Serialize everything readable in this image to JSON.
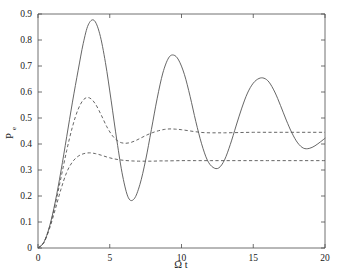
{
  "chart_data": {
    "type": "line",
    "title": "",
    "xlabel": "Ω t",
    "ylabel": "P",
    "ylabel_sub": "e",
    "xlim": [
      0,
      20
    ],
    "ylim": [
      0,
      0.9
    ],
    "xticks": [
      0,
      5,
      10,
      15,
      20
    ],
    "xtick_labels": [
      "0",
      "5",
      "10",
      "15",
      "20"
    ],
    "yticks": [
      0,
      0.1,
      0.2,
      0.3,
      0.4,
      0.5,
      0.6,
      0.7,
      0.8,
      0.9
    ],
    "ytick_labels": [
      "0",
      "0.1",
      "0.2",
      "0.3",
      "0.4",
      "0.5",
      "0.6",
      "0.7",
      "0.8",
      "0.9"
    ],
    "grid": false,
    "legend": "none",
    "axis_color": "#4d4d4d",
    "curve_color": "#555555",
    "series": [
      {
        "name": "undamped-rabi-solid",
        "style": "solid",
        "x": [
          0.0,
          0.4,
          0.8,
          1.2,
          1.6,
          2.0,
          2.4,
          2.8,
          3.15,
          3.5,
          3.9,
          4.3,
          4.7,
          5.1,
          5.5,
          5.9,
          6.3,
          6.7,
          7.1,
          7.5,
          7.9,
          8.3,
          8.7,
          9.1,
          9.45,
          9.8,
          10.2,
          10.6,
          11.0,
          11.4,
          11.8,
          12.2,
          12.6,
          13.0,
          13.4,
          13.8,
          14.2,
          14.6,
          15.0,
          15.4,
          15.75,
          16.1,
          16.5,
          16.9,
          17.3,
          17.7,
          18.1,
          18.5,
          18.9,
          19.3,
          19.7,
          20.0
        ],
        "y": [
          0.0,
          0.021,
          0.082,
          0.177,
          0.296,
          0.428,
          0.561,
          0.684,
          0.786,
          0.858,
          0.876,
          0.824,
          0.713,
          0.566,
          0.412,
          0.277,
          0.193,
          0.189,
          0.244,
          0.338,
          0.455,
          0.574,
          0.673,
          0.731,
          0.742,
          0.723,
          0.668,
          0.583,
          0.486,
          0.401,
          0.338,
          0.31,
          0.308,
          0.339,
          0.398,
          0.469,
          0.538,
          0.596,
          0.634,
          0.652,
          0.653,
          0.638,
          0.6,
          0.548,
          0.492,
          0.442,
          0.404,
          0.384,
          0.383,
          0.393,
          0.409,
          0.422
        ]
      },
      {
        "name": "moderate-damping-dashed",
        "style": "dashed",
        "x": [
          0.0,
          0.4,
          0.8,
          1.2,
          1.6,
          2.0,
          2.4,
          2.8,
          3.2,
          3.6,
          4.0,
          4.4,
          4.8,
          5.2,
          5.6,
          6.0,
          6.4,
          6.8,
          7.2,
          7.6,
          8.0,
          8.4,
          8.8,
          9.2,
          9.6,
          10.0,
          10.5,
          11.0,
          11.5,
          12.0,
          12.5,
          13.0,
          14.0,
          15.0,
          16.0,
          17.0,
          18.0,
          19.0,
          20.0
        ],
        "y": [
          0.0,
          0.021,
          0.08,
          0.167,
          0.27,
          0.375,
          0.466,
          0.534,
          0.572,
          0.577,
          0.554,
          0.512,
          0.466,
          0.431,
          0.41,
          0.403,
          0.405,
          0.413,
          0.424,
          0.435,
          0.444,
          0.451,
          0.456,
          0.458,
          0.457,
          0.455,
          0.451,
          0.447,
          0.444,
          0.443,
          0.443,
          0.443,
          0.444,
          0.445,
          0.445,
          0.445,
          0.445,
          0.445,
          0.445
        ]
      },
      {
        "name": "strong-damping-dashed",
        "style": "dashed",
        "x": [
          0.0,
          0.4,
          0.8,
          1.2,
          1.6,
          2.0,
          2.4,
          2.8,
          3.2,
          3.6,
          4.0,
          4.4,
          4.8,
          5.2,
          5.6,
          6.0,
          6.5,
          7.0,
          7.5,
          8.0,
          8.5,
          9.0,
          10.0,
          11.0,
          12.0,
          13.0,
          14.0,
          15.0,
          16.0,
          17.0,
          18.0,
          19.0,
          20.0
        ],
        "y": [
          0.0,
          0.02,
          0.074,
          0.148,
          0.226,
          0.291,
          0.331,
          0.353,
          0.363,
          0.366,
          0.363,
          0.357,
          0.35,
          0.344,
          0.34,
          0.337,
          0.335,
          0.334,
          0.334,
          0.334,
          0.335,
          0.335,
          0.336,
          0.336,
          0.336,
          0.336,
          0.336,
          0.336,
          0.336,
          0.336,
          0.336,
          0.336,
          0.336
        ]
      }
    ]
  }
}
